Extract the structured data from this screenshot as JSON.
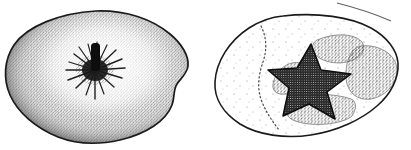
{
  "plate": {
    "title": "Fruit calyx-end comparison plate",
    "background_color": "#ffffff",
    "ink_color": "#1a1a1a",
    "width": 411,
    "height": 150,
    "figure_count": 2,
    "medium": "stipple and line drawing, black ink on white"
  },
  "figures": [
    {
      "id": "figure-left",
      "label": "",
      "style": "stipple-shaded halftone rendering",
      "subject": "fruit viewed from calyx end, fully shaded",
      "outline_color": "#1a1a1a",
      "fill_style": "dense stipple, darker toward the margin, pale toward the centre",
      "center_feature": {
        "name": "calyx-cavity-with-peduncle",
        "description": "dark vertical stem remnant with radiating dark fibres",
        "color": "#101010"
      },
      "bounds": {
        "x": 4,
        "y": 10,
        "width": 186,
        "height": 135
      }
    },
    {
      "id": "figure-right",
      "label": "",
      "style": "outline line drawing with stippled patches",
      "subject": "fruit viewed from calyx end, schematic",
      "outline_color": "#1a1a1a",
      "fill_style": "sparse stipple with discrete mid-tone patches",
      "center_feature": {
        "name": "five-pointed-calyx-star",
        "description": "dark five-lobed star-shaped calyx, coarsely stippled",
        "points": 5,
        "color": "#141414"
      },
      "patches": [
        {
          "name": "upper-right-lobe-patch",
          "tone": "mid"
        },
        {
          "name": "left-crescent-patch",
          "tone": "mid"
        },
        {
          "name": "lower-band-patch",
          "tone": "mid"
        },
        {
          "name": "right-large-patch",
          "tone": "mid"
        }
      ],
      "internal_boundary": {
        "name": "dotted-sector-line",
        "style": "dotted",
        "description": "dotted line defining the left sector of the fruit"
      },
      "bounds": {
        "x": 225,
        "y": 14,
        "width": 176,
        "height": 124
      }
    }
  ],
  "marks": [
    {
      "name": "stray-diagonal-stroke",
      "description": "faint diagonal ink stroke at the upper right margin",
      "color": "#3a3a3a"
    }
  ]
}
